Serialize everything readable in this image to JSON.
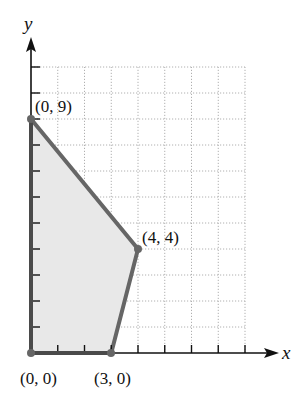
{
  "chart_data": {
    "type": "area",
    "title": "",
    "xlabel": "x",
    "ylabel": "y",
    "xlim": [
      0,
      8
    ],
    "ylim": [
      0,
      11
    ],
    "grid": true,
    "grid_style": "dotted",
    "x_ticks": [
      1,
      2,
      3,
      4,
      5,
      6,
      7,
      8
    ],
    "y_ticks": [
      1,
      2,
      3,
      4,
      5,
      6,
      7,
      8,
      9,
      10,
      11
    ],
    "tick_labels_shown": false,
    "feasible_region": {
      "vertices": [
        [
          0,
          0
        ],
        [
          0,
          9
        ],
        [
          4,
          4
        ],
        [
          3,
          0
        ]
      ],
      "fill_color": "#e8e8e8",
      "edge_color": "#666666"
    },
    "annotations": [
      {
        "text": "(0, 9)",
        "point": [
          0,
          9
        ]
      },
      {
        "text": "(4, 4)",
        "point": [
          4,
          4
        ]
      },
      {
        "text": "(0, 0)",
        "point": [
          0,
          0
        ]
      },
      {
        "text": "(3, 0)",
        "point": [
          3,
          0
        ]
      }
    ]
  },
  "labels": {
    "x_axis": "x",
    "y_axis": "y",
    "p09": "(0, 9)",
    "p44": "(4, 4)",
    "p00": "(0, 0)",
    "p30": "(3, 0)"
  }
}
